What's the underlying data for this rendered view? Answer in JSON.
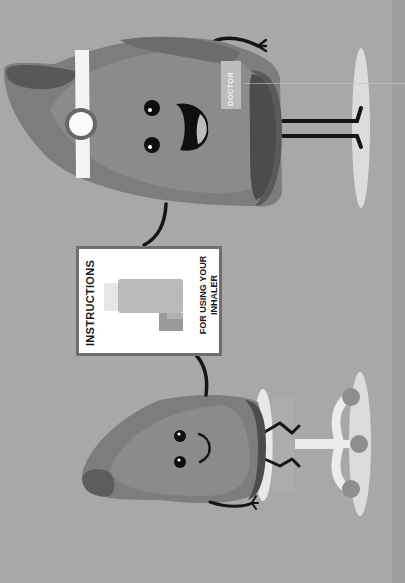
{
  "illustration": {
    "orientation": "rotated-90-ccw",
    "background_color": "#a8a8a8",
    "doctor_character": {
      "badge_label": "DOCTOR",
      "accessories": [
        "head-mirror",
        "headband"
      ]
    },
    "patient_character": {
      "seated_on": "stool",
      "holding": "instruction-card"
    },
    "instruction_card": {
      "title": "INSTRUCTIONS",
      "subtitle_line1": "FOR USING YOUR",
      "subtitle_line2": "INHALER",
      "icon": "inhaler-icon"
    }
  }
}
